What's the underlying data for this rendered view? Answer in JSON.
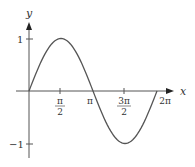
{
  "chart_data": {
    "type": "line",
    "title": "",
    "function": "y = sin x",
    "xlabel": "x",
    "ylabel": "y",
    "xlim": [
      0,
      6.2832
    ],
    "ylim": [
      -1,
      1
    ],
    "grid": false,
    "legend": null,
    "x_ticks": [
      {
        "value": 1.5708,
        "label_num": "π",
        "label_den": "2"
      },
      {
        "value": 3.1416,
        "label": "π"
      },
      {
        "value": 4.7124,
        "label_num": "3π",
        "label_den": "2"
      },
      {
        "value": 6.2832,
        "label": "2π"
      }
    ],
    "y_ticks": [
      {
        "value": 1,
        "label": "1"
      },
      {
        "value": -1,
        "label": "−1"
      }
    ],
    "series": [
      {
        "name": "sin x",
        "x": [
          0,
          0.7854,
          1.5708,
          2.3562,
          3.1416,
          3.927,
          4.7124,
          5.4978,
          6.2832
        ],
        "y": [
          0,
          0.7071,
          1,
          0.7071,
          0,
          -0.7071,
          -1,
          -0.7071,
          0
        ]
      }
    ],
    "colors": {
      "curve": "#555555",
      "axis": "#555555",
      "text": "#333333"
    }
  }
}
